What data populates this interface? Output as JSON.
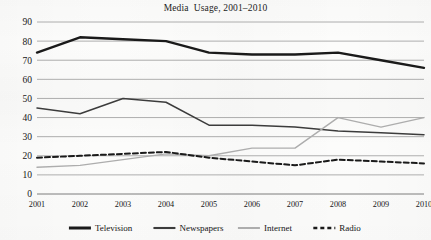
{
  "chart_data": {
    "type": "line",
    "title": "Media  Usage, 2001–2010",
    "xlabel": "",
    "ylabel": "",
    "x": [
      "2001",
      "2002",
      "2003",
      "2004",
      "2005",
      "2006",
      "2007",
      "2008",
      "2009",
      "2010"
    ],
    "categories": [
      "2001",
      "2002",
      "2003",
      "2004",
      "2005",
      "2006",
      "2007",
      "2008",
      "2009",
      "2010"
    ],
    "ylim": [
      0,
      90
    ],
    "ytick_labels": [
      "90",
      "80",
      "70",
      "60",
      "50",
      "40",
      "30",
      "20",
      "10",
      "0"
    ],
    "ytick_values": [
      90,
      80,
      70,
      60,
      50,
      40,
      30,
      20,
      10,
      0
    ],
    "grid": true,
    "legend_position": "bottom",
    "series": [
      {
        "name": "Television",
        "values": [
          74,
          82,
          81,
          80,
          74,
          73,
          73,
          74,
          70,
          66
        ],
        "color": "#1a1a1a",
        "width": 2.4,
        "dash": "none"
      },
      {
        "name": "Newspapers",
        "values": [
          45,
          42,
          50,
          48,
          36,
          36,
          35,
          33,
          32,
          31
        ],
        "color": "#3c3c3c",
        "width": 1.5,
        "dash": "none"
      },
      {
        "name": "Internet",
        "values": [
          14,
          15,
          18,
          21,
          20,
          24,
          24,
          40,
          35,
          40
        ],
        "color": "#adadad",
        "width": 1.4,
        "dash": "none"
      },
      {
        "name": "Radio",
        "values": [
          19,
          20,
          21,
          22,
          19,
          17,
          15,
          18,
          17,
          16
        ],
        "color": "#1a1a1a",
        "width": 2.0,
        "dash": "5,3"
      }
    ]
  },
  "legend": {
    "items": [
      {
        "label": "Television"
      },
      {
        "label": "Newspapers"
      },
      {
        "label": "Internet"
      },
      {
        "label": "Radio"
      }
    ]
  }
}
